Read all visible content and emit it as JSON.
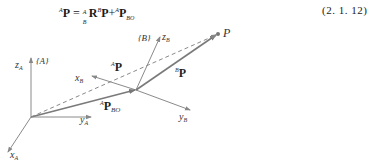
{
  "equation": {
    "lhs_sup": "A",
    "lhs": "P",
    "equals": " = ",
    "rot_sup": "A",
    "rot_sub": "B",
    "rot": "R",
    "bp_sup": "B",
    "bp": "P",
    "plus": "+",
    "pbo_sup": "A",
    "pbo": "P",
    "pbo_sub": "BO",
    "number": "(2. 1. 12)"
  },
  "figure": {
    "frame_A_label": "{A}",
    "frame_B_label": "{B}",
    "axes": {
      "z_A": "z",
      "z_A_sub": "A",
      "y_A": "y",
      "y_A_sub": "A",
      "x_A": "x",
      "x_A_sub": "A",
      "z_B": "z",
      "z_B_sub": "B",
      "y_B": "y",
      "y_B_sub": "B",
      "x_B": "x",
      "x_B_sub": "B"
    },
    "point_label": "P",
    "vectors": {
      "AP_sup": "A",
      "AP": "P",
      "BP_sup": "B",
      "BP": "P",
      "APBO_sup": "A",
      "APBO": "P",
      "APBO_sub": "BO"
    },
    "colors": {
      "axis": "#8a8a8a",
      "vector": "#7a7a7a",
      "dashed": "#8a8a8a"
    }
  }
}
